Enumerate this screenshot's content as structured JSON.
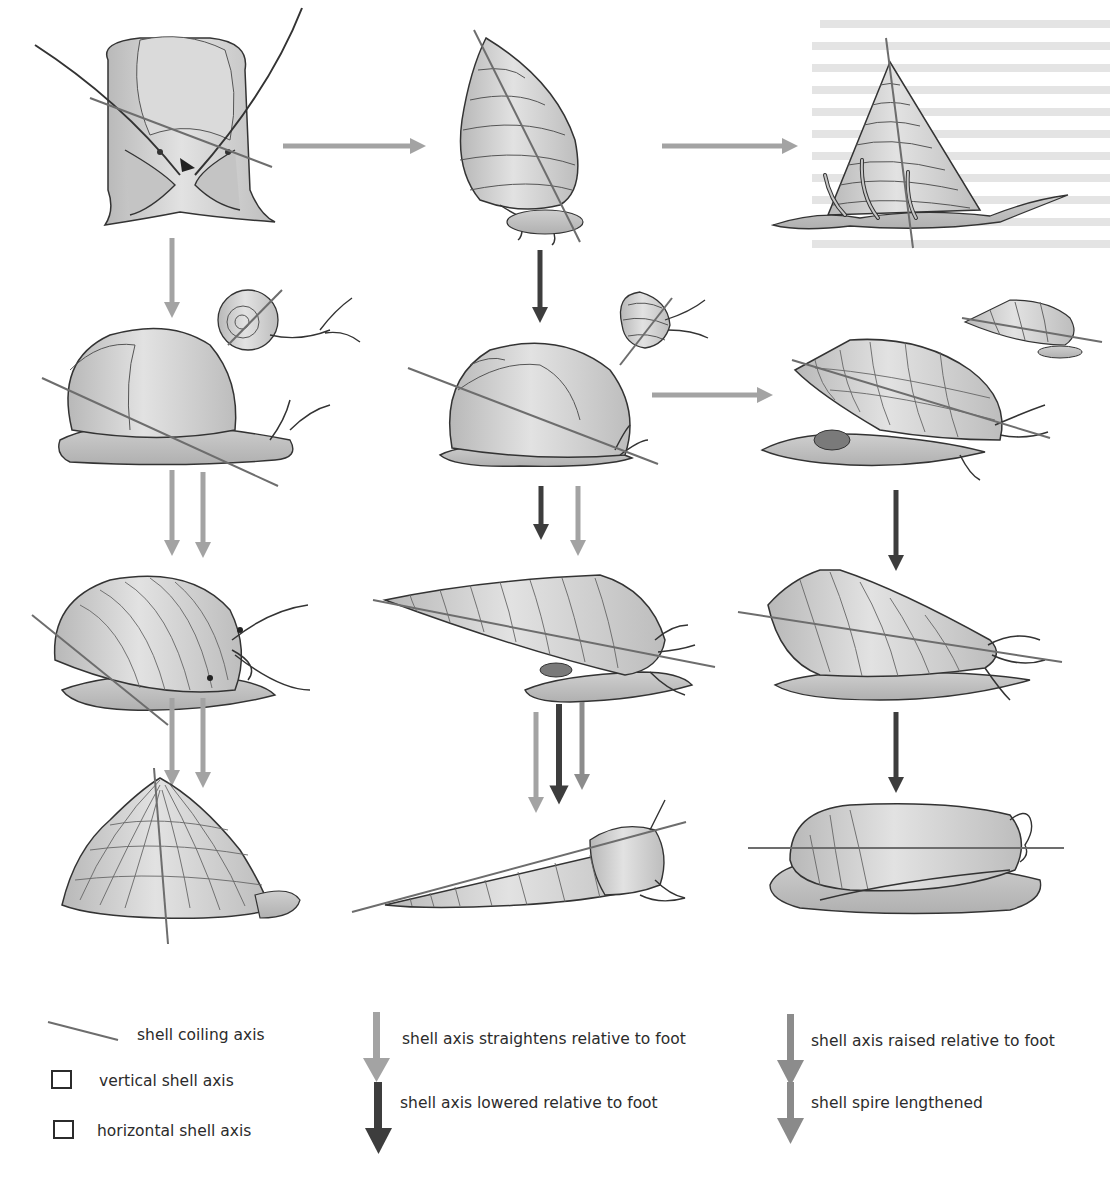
{
  "figure": {
    "type": "evolutionary shell-form transformation diagram",
    "colors": {
      "shell_fill": "#d2d2d2",
      "shell_shade": "#b4b4b4",
      "body_fill": "#bebebe",
      "outline": "#333333",
      "coiling_axis": "#6d6d6d",
      "arrow_straightens": "#a3a3a3",
      "arrow_lowered": "#3d3d3d",
      "arrow_raised": "#8c8c8c",
      "arrow_spire": "#8a8a8a",
      "operculum_dark": "#7a7a7a"
    },
    "rows": [
      {
        "row": 1,
        "forms": [
          "limpet-like front view with tentacles",
          "trochoid conical shell",
          "tall conical shell with epipodial tentacles"
        ]
      },
      {
        "row": 2,
        "forms": [
          "helicoid snail with small planispiral inset",
          "globose snail with small turbinate inset",
          "fusiform ridged shell with small inset"
        ]
      },
      {
        "row": 3,
        "forms": [
          "globular ribbed snail",
          "elongated auger-like shell",
          "cone shell"
        ]
      },
      {
        "row": 4,
        "forms": [
          "flattened limpet cap",
          "slender turritelliform shell",
          "olive/cowry-like involute shell"
        ]
      }
    ],
    "arrows": [
      {
        "from": "row1-col1",
        "to": "row1-col2",
        "direction": "right",
        "style": "straightens"
      },
      {
        "from": "row1-col2",
        "to": "row1-col3",
        "direction": "right",
        "style": "straightens"
      },
      {
        "from": "row1-col1",
        "to": "row2-col1",
        "direction": "down",
        "style": "straightens"
      },
      {
        "from": "row1-col2",
        "to": "row2-col2",
        "direction": "down",
        "style": "lowered"
      },
      {
        "from": "row2-col2",
        "to": "row2-col3",
        "direction": "right",
        "style": "straightens"
      },
      {
        "from": "row2-col1",
        "to": "row3-col1",
        "direction": "down",
        "style": "straightens+raised"
      },
      {
        "from": "row2-col2",
        "to": "row3-col2",
        "direction": "down",
        "style": "lowered+straightens"
      },
      {
        "from": "row2-col3",
        "to": "row3-col3",
        "direction": "down",
        "style": "lowered"
      },
      {
        "from": "row3-col1",
        "to": "row4-col1",
        "direction": "down",
        "style": "straightens+raised"
      },
      {
        "from": "row3-col2",
        "to": "row4-col2",
        "direction": "down",
        "style": "straightens+lowered+spire"
      },
      {
        "from": "row3-col3",
        "to": "row4-col3",
        "direction": "down",
        "style": "lowered"
      }
    ]
  },
  "legend": {
    "items": [
      {
        "symbol": "line",
        "label": "shell coiling axis"
      },
      {
        "symbol": "box",
        "label": "vertical shell axis"
      },
      {
        "symbol": "box",
        "label": "horizontal shell axis"
      },
      {
        "symbol": "arrow-light",
        "label": "shell axis straightens relative to foot"
      },
      {
        "symbol": "arrow-dark",
        "label": "shell axis lowered relative to foot"
      },
      {
        "symbol": "arrow-medium",
        "label": "shell axis raised relative to foot"
      },
      {
        "symbol": "arrow-medium",
        "label": "shell spire lengthened"
      }
    ]
  }
}
